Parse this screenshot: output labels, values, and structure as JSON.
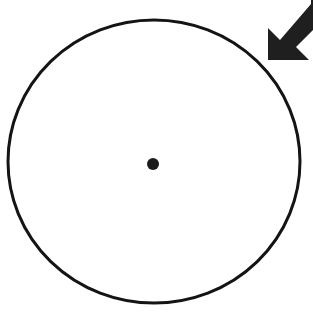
{
  "canvas": {
    "width": 313,
    "height": 312,
    "background_color": "#ffffff"
  },
  "figure": {
    "description": "A large thin-stroked circle occupying most of the frame, a small filled dot marking its center, and a thick solid block arrow in the upper-right corner pointing down and to the left toward the circle's edge."
  },
  "shapes": {
    "circle": {
      "name": "outline-circle",
      "role": "main outline",
      "center_x": 154,
      "center_y": 161.5,
      "radius_x": 146,
      "radius_y": 141.5,
      "stroke_color": "#141414",
      "stroke_width": 3,
      "fill": "none",
      "bounds": {
        "left": 8,
        "top": 20,
        "right": 300,
        "bottom": 303
      }
    },
    "center_dot": {
      "name": "center-point-dot",
      "role": "center marker",
      "center_x": 153,
      "center_y": 164,
      "radius": 6,
      "fill_color": "#1c1c1c",
      "stroke": "none"
    },
    "arrow": {
      "name": "indicator-arrow",
      "role": "pointer annotation",
      "direction": "down-left",
      "angle_degrees": 225,
      "tip_x": 268,
      "tip_y": 46,
      "fill_color": "#1f1f1f",
      "clipped_edges": [
        "top",
        "right"
      ],
      "points": "268,46 268,28 280,40 311,4 311,0 313,0 313,30 296,47 309,60 309,60 285,60 268,60"
    }
  },
  "colors": {
    "background": "#ffffff",
    "ink": "#141414",
    "arrow_fill": "#1f1f1f",
    "dot_fill": "#1c1c1c"
  }
}
